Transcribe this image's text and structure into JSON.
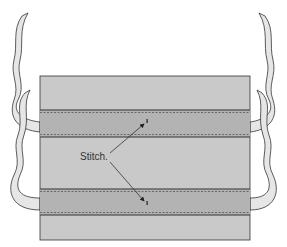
{
  "diagram": {
    "type": "sewing-instruction",
    "label": "Stitch.",
    "colors": {
      "panel": "#c9c9c9",
      "band": "#b3b3b3",
      "ribbon": "#e6e6e6",
      "outline": "#333333",
      "background": "#ffffff"
    },
    "bands": [
      {
        "name": "top-casing",
        "y_top": 110,
        "y_bottom": 137
      },
      {
        "name": "bottom-casing",
        "y_top": 189,
        "y_bottom": 215
      }
    ]
  }
}
